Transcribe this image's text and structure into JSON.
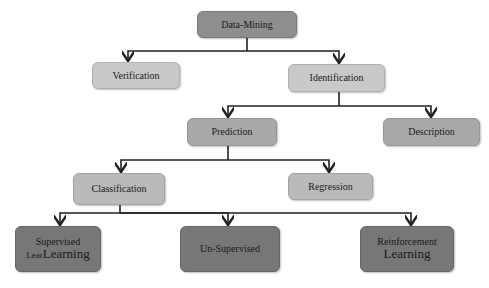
{
  "diagram": {
    "type": "tree",
    "root": "Data-Mining",
    "nodes": {
      "data_mining": {
        "label": "Data-Mining"
      },
      "verification": {
        "label": "Verification"
      },
      "identification": {
        "label": "Identification"
      },
      "prediction": {
        "label": "Prediction"
      },
      "description": {
        "label": "Description"
      },
      "classification": {
        "label": "Classification"
      },
      "regression": {
        "label": "Regression"
      },
      "supervised": {
        "line1": "Supervised",
        "line2_prefix": "Lear",
        "line2": "Learning"
      },
      "unsupervised": {
        "label": "Un-Supervised"
      },
      "reinforcement": {
        "line1": "Reinforcement",
        "line2": "Learning"
      }
    },
    "edges": [
      [
        "Data-Mining",
        "Verification"
      ],
      [
        "Data-Mining",
        "Identification"
      ],
      [
        "Identification",
        "Prediction"
      ],
      [
        "Identification",
        "Description"
      ],
      [
        "Prediction",
        "Classification"
      ],
      [
        "Prediction",
        "Regression"
      ],
      [
        "Classification",
        "Supervised LearLearning"
      ],
      [
        "Classification",
        "Un-Supervised"
      ],
      [
        "Classification",
        "Reinforcement Learning"
      ]
    ],
    "colors": {
      "root": "#8e8e8e",
      "level1": "#c9c9c9",
      "level2": "#a9a9a9",
      "level3": "#bababa",
      "leaf": "#777777",
      "edge": "#222222"
    }
  }
}
